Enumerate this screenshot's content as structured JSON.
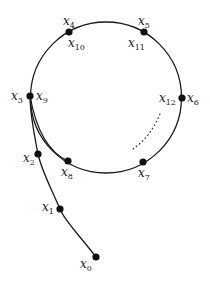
{
  "diagram": {
    "colors": {
      "stroke": "#1a1a1a",
      "point": "#111111",
      "text": "#222222",
      "background": "#ffffff"
    },
    "circle": {
      "cx": 106,
      "cy": 97.5,
      "r": 75.5
    },
    "tail_path": "M96,257 C80,236 64,220 60,209 C52,190 42,172 38,154 C34,134 30,114 30,96",
    "inner_curve": "M30,96 C36,130 48,152 68,161",
    "dotted_curve": "M160,114 C154,128 146,140 133,149",
    "points": [
      {
        "id": "x0",
        "x": 96,
        "y": 257,
        "labels": [
          {
            "base": "x",
            "sub": "0",
            "lx": 80,
            "ly": 268
          }
        ]
      },
      {
        "id": "x1",
        "x": 60,
        "y": 209,
        "labels": [
          {
            "base": "x",
            "sub": "1",
            "lx": 42,
            "ly": 211
          }
        ]
      },
      {
        "id": "x2",
        "x": 38,
        "y": 154,
        "labels": [
          {
            "base": "x",
            "sub": "2",
            "lx": 23,
            "ly": 162
          }
        ]
      },
      {
        "id": "x3-x9",
        "x": 30,
        "y": 96,
        "labels": [
          {
            "base": "x",
            "sub": "3",
            "lx": 11,
            "ly": 100
          },
          {
            "base": "x",
            "sub": "9",
            "lx": 36,
            "ly": 100
          }
        ]
      },
      {
        "id": "x4-x10",
        "x": 69,
        "y": 32,
        "labels": [
          {
            "base": "x",
            "sub": "4",
            "lx": 63,
            "ly": 25
          },
          {
            "base": "x",
            "sub": "10",
            "lx": 68,
            "ly": 47
          }
        ]
      },
      {
        "id": "x5-x11",
        "x": 144,
        "y": 32,
        "labels": [
          {
            "base": "x",
            "sub": "5",
            "lx": 138,
            "ly": 25
          },
          {
            "base": "x",
            "sub": "11",
            "lx": 128,
            "ly": 47
          }
        ]
      },
      {
        "id": "x12-x6",
        "x": 182,
        "y": 98,
        "labels": [
          {
            "base": "x",
            "sub": "12",
            "lx": 159,
            "ly": 102
          },
          {
            "base": "x",
            "sub": "6",
            "lx": 187,
            "ly": 102
          }
        ]
      },
      {
        "id": "x7",
        "x": 143,
        "y": 162,
        "labels": [
          {
            "base": "x",
            "sub": "7",
            "lx": 138,
            "ly": 177
          }
        ]
      },
      {
        "id": "x8",
        "x": 68,
        "y": 161,
        "labels": [
          {
            "base": "x",
            "sub": "8",
            "lx": 61,
            "ly": 176
          }
        ]
      }
    ]
  }
}
